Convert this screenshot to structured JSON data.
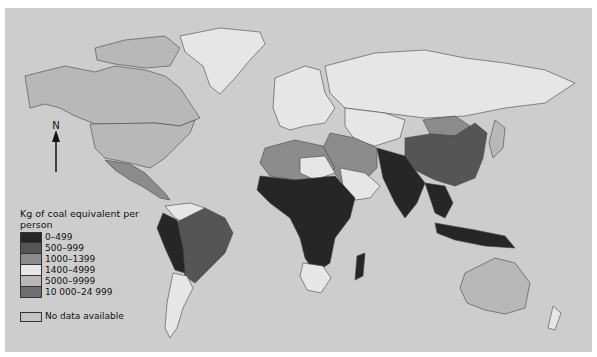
{
  "map": {
    "type": "choropleth world map",
    "background_color": "#cdcdcd",
    "north_arrow": {
      "label": "N"
    }
  },
  "legend": {
    "title": "Kg of coal equivalent per person",
    "classes": [
      {
        "label": "0–499",
        "color": "#262626"
      },
      {
        "label": "500–999",
        "color": "#555555"
      },
      {
        "label": "1000–1399",
        "color": "#8c8c8c"
      },
      {
        "label": "1400–4999",
        "color": "#e6e6e6"
      },
      {
        "label": "5000–9999",
        "color": "#b8b8b8"
      },
      {
        "label": "10 000–24 999",
        "color": "#6e6e6e"
      }
    ],
    "no_data": {
      "label": "No data available",
      "color": "#c4c4c4"
    }
  }
}
